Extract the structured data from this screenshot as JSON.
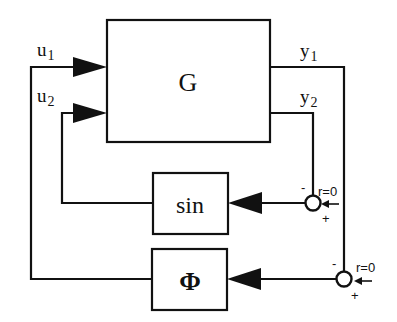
{
  "diagram": {
    "type": "block-diagram",
    "blocks": {
      "plant": {
        "label": "G"
      },
      "sin": {
        "label": "sin"
      },
      "phi": {
        "label": "Φ"
      }
    },
    "signals": {
      "u1": {
        "base": "u",
        "sub": "1"
      },
      "u2": {
        "base": "u",
        "sub": "2"
      },
      "y1": {
        "base": "y",
        "sub": "1"
      },
      "y2": {
        "base": "y",
        "sub": "2"
      }
    },
    "junctions": {
      "sin_junction": {
        "minus": "-",
        "plus": "+",
        "reference": "r=0"
      },
      "phi_junction": {
        "minus": "-",
        "plus": "+",
        "reference": "r=0"
      }
    },
    "colors": {
      "stroke": "#111111",
      "background": "#ffffff"
    }
  }
}
